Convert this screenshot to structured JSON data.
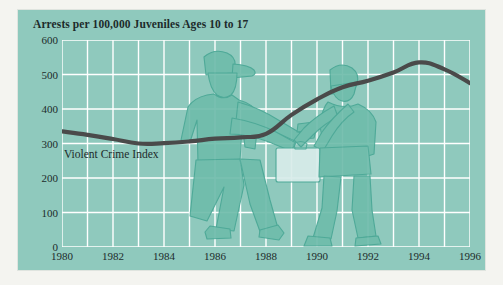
{
  "figure": {
    "title": "Arrests per 100,000 Juveniles Ages 10 to 17",
    "series_label": "Violent Crime Index",
    "panel_color": "#8fc9bd",
    "grid_color": "#ffffff",
    "line_color": "#4a4a4a",
    "text_color": "#1d2b2b",
    "illustration": {
      "figures": [
        "offender-pointing-gun",
        "victim-hands-raised-with-briefcase"
      ],
      "fill_color": "#6fbcab",
      "outline_color": "#4aa796"
    }
  },
  "chart_data": {
    "type": "line",
    "title": "Arrests per 100,000 Juveniles Ages 10 to 17",
    "xlabel": "",
    "ylabel": "",
    "xlim": [
      1980,
      1996
    ],
    "ylim": [
      0,
      600
    ],
    "yticks": [
      0,
      100,
      200,
      300,
      400,
      500,
      600
    ],
    "ytick_labels": [
      "0",
      "100",
      "200",
      "300",
      "400",
      "500",
      "600"
    ],
    "xticks": [
      1980,
      1982,
      1984,
      1986,
      1988,
      1990,
      1992,
      1994,
      1996
    ],
    "xtick_labels": [
      "1980",
      "1982",
      "1984",
      "1986",
      "1988",
      "1990",
      "1992",
      "1994",
      "1996"
    ],
    "grid": true,
    "grid_x_every": 1,
    "grid_y_every": 100,
    "legend": "inline-label",
    "series": [
      {
        "name": "Violent Crime Index",
        "x": [
          1980,
          1981,
          1982,
          1983,
          1984,
          1985,
          1986,
          1987,
          1988,
          1989,
          1990,
          1991,
          1992,
          1993,
          1994,
          1995,
          1996
        ],
        "values": [
          335,
          325,
          313,
          300,
          301,
          306,
          314,
          318,
          328,
          383,
          428,
          463,
          482,
          506,
          535,
          515,
          475
        ]
      }
    ]
  }
}
